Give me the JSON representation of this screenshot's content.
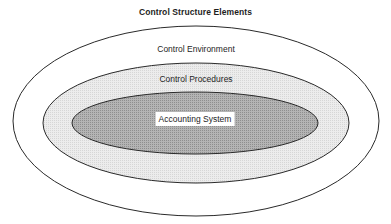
{
  "title": "Control Structure Elements",
  "layers": [
    {
      "id": "control-environment",
      "label": "Control Environment",
      "fill": "#ffffff",
      "stroke": "#2a2a2a",
      "cx": 196,
      "cy": 121,
      "rx": 183,
      "ry": 95
    },
    {
      "id": "control-procedures",
      "label": "Control Procedures",
      "fill": "#e4e4e4",
      "stroke": "#2a2a2a",
      "cx": 196,
      "cy": 123,
      "rx": 153,
      "ry": 60
    },
    {
      "id": "accounting-system",
      "label": "Accounting System",
      "fill": "#a9a9a9",
      "stroke": "#2a2a2a",
      "cx": 195,
      "cy": 123,
      "rx": 123,
      "ry": 31
    }
  ]
}
